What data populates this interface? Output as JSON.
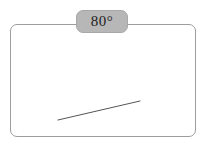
{
  "canvas": {
    "width": 205,
    "height": 147,
    "background_color": "#ffffff"
  },
  "frame": {
    "name": "bounding-rectangle",
    "border_color": "#9d9d9d",
    "border_width": 1,
    "corner_radius": 7,
    "x": 10,
    "y": 24,
    "width": 186,
    "height": 113
  },
  "badge": {
    "label": "80°",
    "value": 80,
    "unit": "degrees",
    "fill_color": "#b7b7b7",
    "border_color": "#a8a8a8",
    "text_color": "#1d1d1d",
    "x": 76,
    "y": 10,
    "width": 52,
    "height": 23
  },
  "segment": {
    "name": "diagonal-line",
    "color": "#555555",
    "stroke_width": 1,
    "x1": 58,
    "y1": 120,
    "x2": 140,
    "y2": 101
  }
}
